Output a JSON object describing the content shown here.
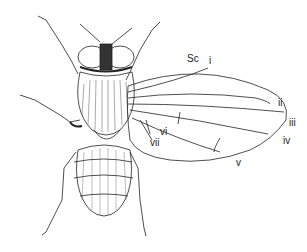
{
  "figure": {
    "labels": {
      "sc": "Sc",
      "i": "i",
      "ii": "ii",
      "iii": "iii",
      "iv": "iv",
      "v": "v",
      "vi": "vi",
      "vii": "vii"
    },
    "colors": {
      "ink": "#222222",
      "background": "#ffffff"
    }
  }
}
